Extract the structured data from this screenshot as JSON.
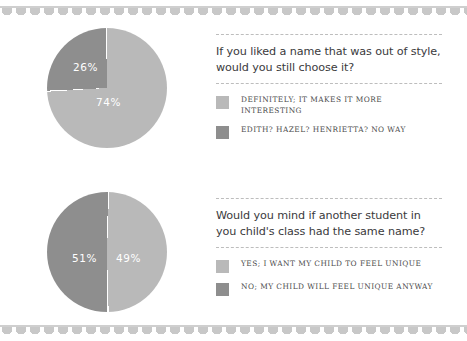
{
  "page": {
    "background": "#ffffff",
    "border_color": "#c8c8c8"
  },
  "palette": {
    "light": "#b9b9b9",
    "dark": "#8e8e8e",
    "label_text": "#ffffff",
    "question_text": "#3a3a3c",
    "legend_text": "#4a4a4a",
    "rule": "#bdbdbd"
  },
  "chart_data": [
    {
      "type": "pie",
      "title": "If you liked a name that was out of style, would you still choose it?",
      "labels": [
        "DEFINITELY; IT MAKES IT MORE INTERESTING",
        "EDITH? HAZEL? HENRIETTA? NO WAY"
      ],
      "values": [
        74,
        26
      ],
      "value_labels": [
        "74%",
        "26%"
      ],
      "colors": [
        "#b9b9b9",
        "#8e8e8e"
      ],
      "legend_position": "below",
      "start_angle_deg": 0,
      "direction": "counterclockwise"
    },
    {
      "type": "pie",
      "title": "Would you mind if another student in you child's class had the same name?",
      "labels": [
        "YES; I WANT MY CHILD TO FEEL UNIQUE",
        "NO; MY CHILD WILL FEEL UNIQUE ANYWAY"
      ],
      "values": [
        49,
        51
      ],
      "value_labels": [
        "49%",
        "51%"
      ],
      "colors": [
        "#b9b9b9",
        "#8e8e8e"
      ],
      "legend_position": "below",
      "start_angle_deg": 0,
      "direction": "clockwise"
    }
  ],
  "blocks": [
    {
      "question": "If you liked a name that was out of style, would you still choose it?",
      "legend": [
        {
          "label": "DEFINITELY; IT MAKES IT MORE INTERESTING",
          "color": "#b9b9b9"
        },
        {
          "label": "EDITH? HAZEL? HENRIETTA? NO WAY",
          "color": "#8e8e8e"
        }
      ]
    },
    {
      "question": "Would you mind if another student in you child's class had the same name?",
      "legend": [
        {
          "label": "YES; I WANT MY CHILD TO FEEL UNIQUE",
          "color": "#b9b9b9"
        },
        {
          "label": "NO; MY CHILD WILL FEEL UNIQUE ANYWAY",
          "color": "#8e8e8e"
        }
      ]
    }
  ]
}
